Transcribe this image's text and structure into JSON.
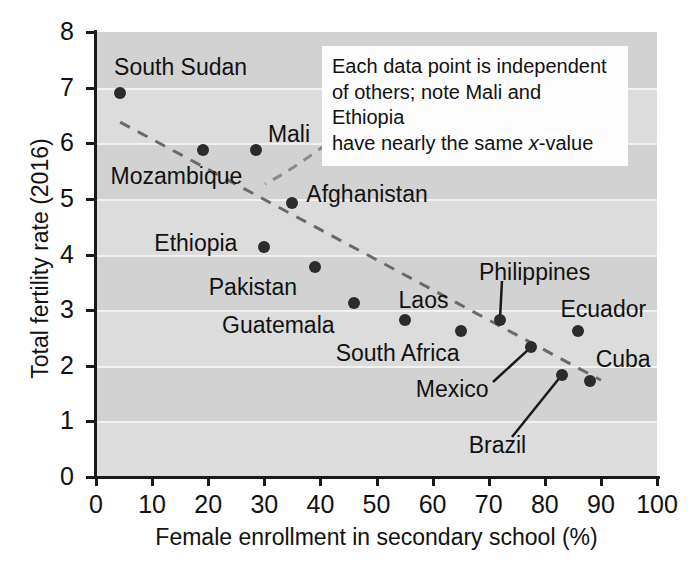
{
  "chart_data": {
    "type": "scatter",
    "title": "",
    "xlabel": "Female enrollment in secondary school (%)",
    "ylabel": "Total fertility rate (2016)",
    "xlim": [
      0,
      100
    ],
    "ylim": [
      0,
      8
    ],
    "xticks": [
      0,
      10,
      20,
      30,
      40,
      50,
      60,
      70,
      80,
      90,
      100
    ],
    "yticks": [
      0,
      1,
      2,
      3,
      4,
      5,
      6,
      7,
      8
    ],
    "grid": true,
    "legend": "none",
    "point_color": "#2b2b2b",
    "plot_bg": "#d2d2d2",
    "band_color": "#dcdcdc",
    "trendline": {
      "style": "dashed",
      "color": "#6a6a6a",
      "x": [
        4.3,
        90.0
      ],
      "y": [
        6.38,
        1.74
      ]
    },
    "points": [
      {
        "name": "South Sudan",
        "x": 4.3,
        "y": 6.9,
        "label_dx": -6,
        "label_dy": -26,
        "label_anchor": "start"
      },
      {
        "name": "Mozambique",
        "x": 19.0,
        "y": 5.87,
        "label_dx": -92,
        "label_dy": 26,
        "label_anchor": "start"
      },
      {
        "name": "Mali",
        "x": 28.5,
        "y": 5.87,
        "label_dx": 12,
        "label_dy": -16,
        "label_anchor": "start"
      },
      {
        "name": "Afghanistan",
        "x": 35.0,
        "y": 4.93,
        "label_dx": 14,
        "label_dy": -9,
        "label_anchor": "start"
      },
      {
        "name": "Ethiopia",
        "x": 30.0,
        "y": 4.13,
        "label_dx": -110,
        "label_dy": -4,
        "label_anchor": "start"
      },
      {
        "name": "Pakistan",
        "x": 39.0,
        "y": 3.77,
        "label_dx": -106,
        "label_dy": 20,
        "label_anchor": "start"
      },
      {
        "name": "Guatemala",
        "x": 46.0,
        "y": 3.13,
        "label_dx": -132,
        "label_dy": 22,
        "label_anchor": "start"
      },
      {
        "name": "Laos",
        "x": 55.0,
        "y": 2.83,
        "label_dx": -6,
        "label_dy": -20,
        "label_anchor": "start"
      },
      {
        "name": "South Africa",
        "x": 65.0,
        "y": 2.62,
        "label_dx": -125,
        "label_dy": 22,
        "label_anchor": "start"
      },
      {
        "name": "Philippines",
        "x": 72.0,
        "y": 2.82,
        "label_dx": -21,
        "label_dy": -48,
        "label_anchor": "start"
      },
      {
        "name": "Mexico",
        "x": 77.5,
        "y": 2.33,
        "label_dx": -115,
        "label_dy": 42,
        "label_anchor": "start"
      },
      {
        "name": "Ecuador",
        "x": 86.0,
        "y": 2.62,
        "label_dx": -18,
        "label_dy": -22,
        "label_anchor": "start"
      },
      {
        "name": "Brazil",
        "x": 83.0,
        "y": 1.83,
        "label_dx": -93,
        "label_dy": 70,
        "label_anchor": "start"
      },
      {
        "name": "Cuba",
        "x": 88.0,
        "y": 1.72,
        "label_dx": 6,
        "label_dy": -22,
        "label_anchor": "start"
      }
    ],
    "leader_lines": [
      {
        "from": "Philippines",
        "note": "label-to-point connector"
      },
      {
        "from": "Mexico",
        "note": "label-to-point connector"
      },
      {
        "from": "Brazil",
        "note": "label-to-point connector"
      }
    ],
    "annotation": {
      "line1": "Each data point is independent",
      "line2": "of others; note Mali and Ethiopia",
      "line3_pre": "have nearly the same ",
      "line3_em": "x",
      "line3_post": "-value"
    }
  }
}
